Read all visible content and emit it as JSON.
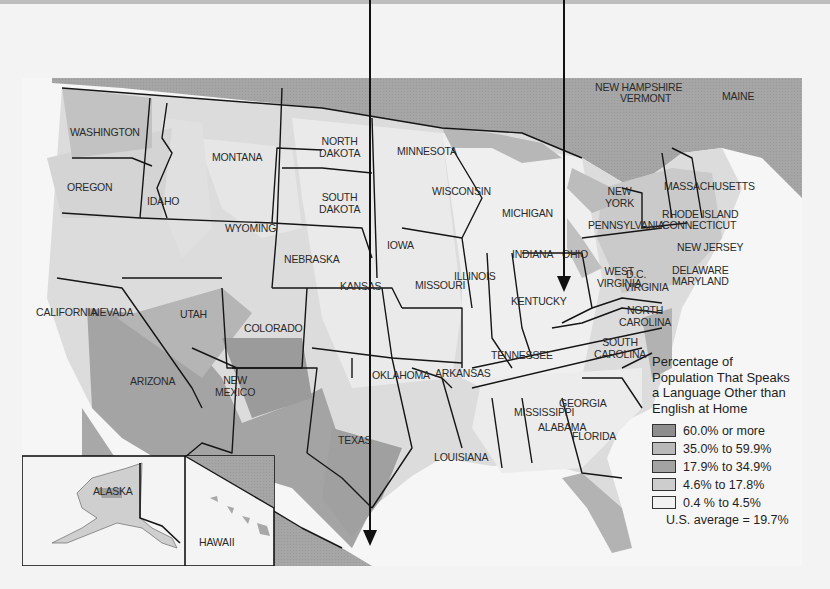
{
  "legend": {
    "title": "Percentage of Population That Speaks a Language Other than English at Home",
    "title_lines": [
      "Percentage of",
      "Population That Speaks",
      "a Language Other than",
      "English at Home"
    ],
    "categories": [
      {
        "label": "60.0% or more",
        "color": "#8e8e8e"
      },
      {
        "label": "35.0% to 59.9%",
        "color": "#b9b9b9"
      },
      {
        "label": "17.9% to 34.9%",
        "color": "#a3a3a3"
      },
      {
        "label": "4.6% to 17.8%",
        "color": "#cdcdcd"
      },
      {
        "label": "0.4 % to 4.5%",
        "color": "#f1f1f1"
      }
    ],
    "us_average": "U.S. average = 19.7%"
  },
  "states": {
    "washington": "WASHINGTON",
    "oregon": "OREGON",
    "california": "CALIFORNIA",
    "idaho": "IDAHO",
    "nevada": "NEVADA",
    "montana": "MONTANA",
    "wyoming": "WYOMING",
    "utah": "UTAH",
    "colorado": "COLORADO",
    "arizona": "ARIZONA",
    "new_mexico_1": "NEW",
    "new_mexico_2": "MEXICO",
    "north_dakota_1": "NORTH",
    "north_dakota_2": "DAKOTA",
    "south_dakota_1": "SOUTH",
    "south_dakota_2": "DAKOTA",
    "nebraska": "NEBRASKA",
    "kansas": "KANSAS",
    "oklahoma": "OKLAHOMA",
    "texas": "TEXAS",
    "minnesota": "MINNESOTA",
    "iowa": "IOWA",
    "missouri": "MISSOURI",
    "arkansas": "ARKANSAS",
    "louisiana": "LOUISIANA",
    "wisconsin": "WISCONSIN",
    "illinois": "ILLINOIS",
    "michigan": "MICHIGAN",
    "indiana": "INDIANA",
    "ohio": "OHIO",
    "kentucky": "KENTUCKY",
    "tennessee": "TENNESSEE",
    "mississippi": "MISSISSIPPI",
    "alabama": "ALABAMA",
    "georgia": "GEORGIA",
    "florida": "FLORIDA",
    "south_carolina_1": "SOUTH",
    "south_carolina_2": "CAROLINA",
    "north_carolina_1": "NORTH",
    "north_carolina_2": "CAROLINA",
    "west_virginia_1": "WEST",
    "west_virginia_2": "VIRGINIA",
    "virginia": "VIRGINIA",
    "dc": "D.C.",
    "pennsylvania": "PENNSYLVANIA",
    "new_york_1": "NEW",
    "new_york_2": "YORK",
    "new_jersey": "NEW JERSEY",
    "delaware": "DELAWARE",
    "maryland": "MARYLAND",
    "massachusetts": "MASSACHUSETTS",
    "rhode_island": "RHODE ISLAND",
    "connecticut": "CONNECTICUT",
    "new_hampshire": "NEW HAMPSHIRE",
    "vermont": "VERMONT",
    "maine": "MAINE",
    "alaska": "ALASKA",
    "hawaii": "HAWAII"
  },
  "colors": {
    "water_foreign": "#a8a8a8",
    "background": "#f3f3f3",
    "border": "#151515"
  }
}
